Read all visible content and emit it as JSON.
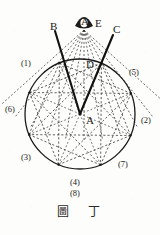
{
  "figure": {
    "caption": "圖 丁",
    "caption_parts": [
      "圖",
      "丁"
    ],
    "background_color": "#fdfdfb",
    "ink_color": "#1a1a1a"
  },
  "geometry": {
    "circle": {
      "cx": 80,
      "cy": 114,
      "r": 55,
      "stroke": "#1a1a1a",
      "stroke_width": 1.3
    },
    "center_point": {
      "x": 80,
      "y": 114
    },
    "apex_point": {
      "x": 84,
      "y": 24
    },
    "num_vertices": 8,
    "star_step": 3,
    "vertex_angles_deg": [
      -115,
      5,
      -155,
      95,
      -60,
      180,
      50,
      90
    ]
  },
  "labels": {
    "letters": [
      {
        "name": "B",
        "text": "B",
        "x": 50,
        "y": 30
      },
      {
        "name": "E",
        "text": "E",
        "x": 95,
        "y": 27
      },
      {
        "name": "A_apex",
        "text": "A",
        "x": 81,
        "y": 25
      },
      {
        "name": "C",
        "text": "C",
        "x": 113,
        "y": 33
      },
      {
        "name": "D",
        "text": "D",
        "x": 86,
        "y": 68
      },
      {
        "name": "A_center",
        "text": "A",
        "x": 86,
        "y": 124
      }
    ],
    "numbers": [
      {
        "name": "point-1",
        "text": "(1)",
        "x": 21,
        "y": 66
      },
      {
        "name": "point-5",
        "text": "(5)",
        "x": 129,
        "y": 75
      },
      {
        "name": "point-6",
        "text": "(6)",
        "x": 5,
        "y": 112
      },
      {
        "name": "point-2",
        "text": "(2)",
        "x": 141,
        "y": 123
      },
      {
        "name": "point-3",
        "text": "(3)",
        "x": 21,
        "y": 160
      },
      {
        "name": "point-7",
        "text": "(7)",
        "x": 118,
        "y": 167
      },
      {
        "name": "point-4",
        "text": "(4)",
        "x": 70,
        "y": 185
      },
      {
        "name": "point-8",
        "text": "(8)",
        "x": 70,
        "y": 196
      }
    ]
  },
  "lines": {
    "solid": [
      {
        "name": "line-B-to-A",
        "x1": 55,
        "y1": 31,
        "x2": 80,
        "y2": 114
      },
      {
        "name": "line-C-to-A",
        "x1": 113,
        "y1": 35,
        "x2": 80,
        "y2": 114
      }
    ],
    "ray_count_from_apex": 11,
    "dashed_style": "2,2"
  }
}
